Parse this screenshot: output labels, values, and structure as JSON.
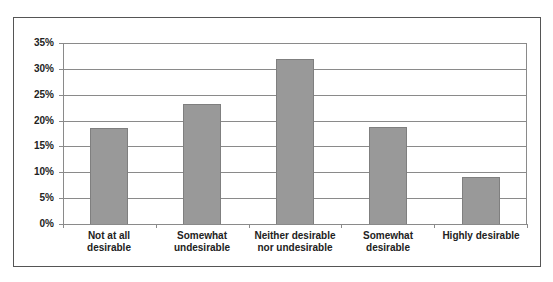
{
  "chart_data": {
    "type": "bar",
    "title": "",
    "xlabel": "",
    "ylabel": "",
    "categories": [
      "Not at all desirable",
      "Somewhat undesirable",
      "Neither desirable nor undesirable",
      "Somewhat desirable",
      "Highly desirable"
    ],
    "values": [
      18.5,
      23.2,
      32.0,
      18.8,
      9.1
    ],
    "value_unit": "%",
    "ylim": [
      0,
      35
    ],
    "yticks": [
      0,
      5,
      10,
      15,
      20,
      25,
      30,
      35
    ],
    "ytick_labels": [
      "0%",
      "5%",
      "10%",
      "15%",
      "20%",
      "25%",
      "30%",
      "35%"
    ],
    "grid": true,
    "legend": null,
    "bar_color": "#999999"
  },
  "axis": {
    "y_labels": [
      "35%",
      "30%",
      "25%",
      "20%",
      "15%",
      "10%",
      "5%",
      "0%"
    ]
  },
  "x_labels": [
    "Not at all\ndesirable",
    "Somewhat\nundesirable",
    "Neither desirable\nnor undesirable",
    "Somewhat\ndesirable",
    "Highly desirable"
  ]
}
